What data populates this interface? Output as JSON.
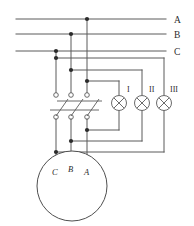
{
  "diagram": {
    "type": "electrical-schematic",
    "background_color": "#ffffff",
    "wire_color": "#5a5a5a",
    "node_color": "#2b2b2b",
    "phase_lines": [
      {
        "label": "A",
        "y": 19
      },
      {
        "label": "B",
        "y": 34
      },
      {
        "label": "C",
        "y": 51
      }
    ],
    "lamps": [
      {
        "label": "I",
        "cx": 119,
        "cy": 103
      },
      {
        "label": "II",
        "cx": 142,
        "cy": 103
      },
      {
        "label": "III",
        "cx": 164,
        "cy": 103
      }
    ],
    "switch": {
      "name": "three-pole-knife-switch",
      "poles": 3,
      "pole_x": [
        56,
        71,
        87
      ],
      "top_terminal_y": 95,
      "bottom_terminal_y": 117
    },
    "motor": {
      "label": "motor",
      "cx": 72,
      "cy": 186,
      "r": 35,
      "terminals": [
        {
          "label": "C",
          "x": 56
        },
        {
          "label": "B",
          "x": 71
        },
        {
          "label": "A",
          "x": 87
        }
      ]
    }
  }
}
